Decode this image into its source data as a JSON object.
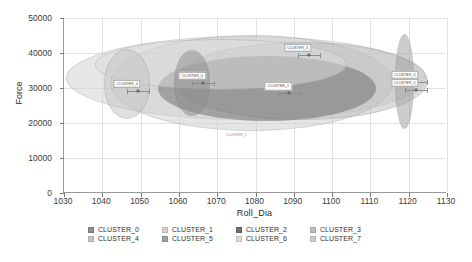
{
  "chart_data": {
    "type": "scatter",
    "title": "",
    "xlabel": "Roll_Dia",
    "ylabel": "Force",
    "xlim": [
      1030,
      1130
    ],
    "ylim": [
      0,
      50000
    ],
    "xticks": [
      1030,
      1040,
      1050,
      1060,
      1070,
      1080,
      1090,
      1100,
      1110,
      1120,
      1130
    ],
    "yticks": [
      0,
      10000,
      20000,
      30000,
      40000,
      50000
    ],
    "grid": true,
    "legend_position": "bottom",
    "series": [
      {
        "name": "CLUSTER_0",
        "color": "#8f8f8f",
        "center_x": 1063.5,
        "center_y": 31500,
        "width_x": 9.5,
        "height_y": 19000,
        "angle_deg": 0,
        "label_text": "CLUSTER_0"
      },
      {
        "name": "CLUSTER_1",
        "color": "#d2d2d2",
        "center_x": 1077.5,
        "center_y": 33000,
        "width_x": 94.0,
        "height_y": 24000,
        "angle_deg": 0,
        "label_text": "CLUSTER_1"
      },
      {
        "name": "CLUSTER_2",
        "color": "#6e6e6e",
        "center_x": 1083.0,
        "center_y": 29800,
        "width_x": 57.0,
        "height_y": 18500,
        "angle_deg": 0,
        "label_text": "CLUSTER_2"
      },
      {
        "name": "CLUSTER_3",
        "color": "#bdbdbd",
        "center_x": 1092.0,
        "center_y": 32000,
        "width_x": 66.0,
        "height_y": 22500,
        "angle_deg": 0,
        "label_text": "CLUSTER_3"
      },
      {
        "name": "CLUSTER_4",
        "color": "#c5c5c5",
        "center_x": 1046.5,
        "center_y": 31200,
        "width_x": 12.0,
        "height_y": 20000,
        "angle_deg": 0,
        "label_text": "CLUSTER_4"
      },
      {
        "name": "CLUSTER_5",
        "color": "#a0a0a0",
        "center_x": 1119.0,
        "center_y": 31800,
        "width_x": 5.0,
        "height_y": 27000,
        "angle_deg": 0,
        "label_text": "CLUSTER_5"
      },
      {
        "name": "CLUSTER_6",
        "color": "#dcdcdc",
        "center_x": 1071.0,
        "center_y": 36800,
        "width_x": 66.0,
        "height_y": 14500,
        "angle_deg": 0,
        "label_text": "CLUSTER_6"
      },
      {
        "name": "CLUSTER_7",
        "color": "#cfcfcf",
        "center_x": 1079.0,
        "center_y": 31500,
        "width_x": 74.0,
        "height_y": 27500,
        "angle_deg": 0,
        "label_text": "CLUSTER_7"
      }
    ],
    "annotations": [
      {
        "text": "CLUSTER_4",
        "x": 1046.5,
        "y": 31200,
        "style": "boxed"
      },
      {
        "text": "CLUSTER_0",
        "x": 1063.5,
        "y": 33500,
        "style": "boxed"
      },
      {
        "text": "CLUSTER_3",
        "x": 1091.0,
        "y": 41500,
        "style": "boxed"
      },
      {
        "text": "CLUSTER_2",
        "x": 1086.0,
        "y": 30500,
        "style": "boxed"
      },
      {
        "text": "CLUSTER_6",
        "x": 1119.0,
        "y": 33800,
        "style": "boxed"
      },
      {
        "text": "CLUSTER_5",
        "x": 1119.0,
        "y": 31500,
        "style": "boxed"
      },
      {
        "text": "CLUSTER_1",
        "x": 1075.0,
        "y": 16500,
        "style": "plain"
      }
    ]
  },
  "axes": {
    "x_title": "Roll_Dia",
    "y_title": "Force",
    "x_tick_labels": [
      "1030",
      "1040",
      "1050",
      "1060",
      "1070",
      "1080",
      "1090",
      "1100",
      "1110",
      "1120",
      "1130"
    ],
    "y_tick_labels": [
      "0",
      "10000",
      "20000",
      "30000",
      "40000",
      "50000"
    ]
  },
  "legend": {
    "rows": [
      [
        {
          "label": "CLUSTER_0",
          "color": "#8f8f8f"
        },
        {
          "label": "CLUSTER_1",
          "color": "#d2d2d2"
        },
        {
          "label": "CLUSTER_2",
          "color": "#6e6e6e"
        },
        {
          "label": "CLUSTER_3",
          "color": "#bdbdbd"
        }
      ],
      [
        {
          "label": "CLUSTER_4",
          "color": "#c5c5c5"
        },
        {
          "label": "CLUSTER_5",
          "color": "#a0a0a0"
        },
        {
          "label": "CLUSTER_6",
          "color": "#dcdcdc"
        },
        {
          "label": "CLUSTER_7",
          "color": "#cfcfcf"
        }
      ]
    ]
  }
}
